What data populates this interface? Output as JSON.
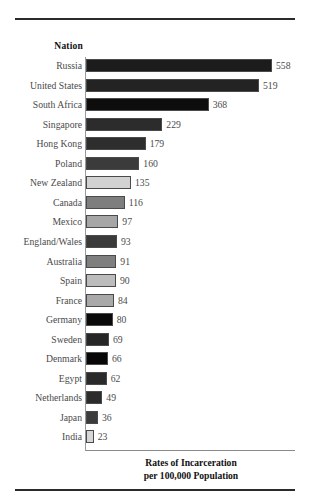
{
  "figure": {
    "column_header": "Nation",
    "caption_line1": "Rates of Incarceration",
    "caption_line2": "per 100,000 Population"
  },
  "chart_data": {
    "type": "bar",
    "orientation": "horizontal",
    "title": "Rates of Incarceration per 100,000 Population",
    "xlabel": "Rates of Incarceration per 100,000 Population",
    "ylabel": "Nation",
    "grid": false,
    "legend": false,
    "xlim": [
      0,
      558
    ],
    "categories": [
      "Russia",
      "United States",
      "South Africa",
      "Singapore",
      "Hong Kong",
      "Poland",
      "New Zealand",
      "Canada",
      "Mexico",
      "England/Wales",
      "Australia",
      "Spain",
      "France",
      "Germany",
      "Sweden",
      "Denmark",
      "Egypt",
      "Netherlands",
      "Japan",
      "India"
    ],
    "values": [
      558,
      519,
      368,
      229,
      179,
      160,
      135,
      116,
      97,
      93,
      91,
      90,
      84,
      80,
      69,
      66,
      62,
      49,
      36,
      23
    ],
    "bar_colors": [
      "#1c1c1c",
      "#232323",
      "#0d0d0d",
      "#2c2c2c",
      "#2e2e2e",
      "#3b3b3b",
      "#d2d2d2",
      "#7e7e7e",
      "#a6a6a6",
      "#3a3a3a",
      "#7f7f7f",
      "#bcbcbc",
      "#a9a9a9",
      "#0a0a0a",
      "#262626",
      "#070707",
      "#2a2a2a",
      "#2b2b2b",
      "#3c3c3c",
      "#d6d6d6"
    ]
  }
}
